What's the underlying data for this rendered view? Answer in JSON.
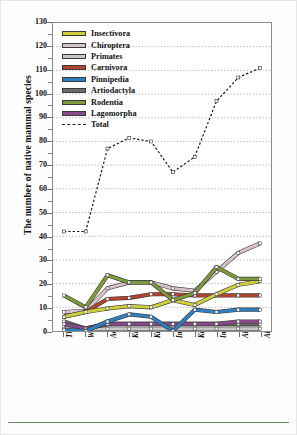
{
  "chart_data": {
    "type": "line",
    "title": "",
    "xlabel": "",
    "ylabel": "The number of native mammal species",
    "ylim": [
      0,
      130
    ],
    "ytick_step": 10,
    "yticks": [
      0,
      10,
      20,
      30,
      40,
      50,
      60,
      70,
      80,
      90,
      100,
      110,
      120,
      130
    ],
    "grid": true,
    "legend_position": "top-left",
    "categories": [
      "Thomas (1906, 1907)",
      "Wallace (1911)",
      "Aoki (1913)",
      "Kishida (1924)",
      "Kuroda (1940)",
      "Imaizumi (1949)",
      "Kuroda (1953)",
      "Imaizumi (1960)",
      "Abe et al. (1994)",
      "Abe et al. (2005)"
    ],
    "series": [
      {
        "name": "Insectivora",
        "color": "#cfcf3c",
        "values": [
          6,
          8,
          9.5,
          10.5,
          10,
          13,
          11,
          15.5,
          19.5,
          21
        ]
      },
      {
        "name": "Chiroptera",
        "color": "#d8c2cc",
        "values": [
          8,
          8.5,
          18,
          20.5,
          20.5,
          18,
          17,
          25,
          33,
          37
        ]
      },
      {
        "name": "Primates",
        "color": "#c8c8c8",
        "values": [
          1,
          1,
          1,
          1,
          1,
          1,
          1,
          1,
          1,
          1
        ]
      },
      {
        "name": "Carnivora",
        "color": "#b04430",
        "values": [
          6,
          8,
          13.5,
          14,
          15.5,
          15.5,
          15,
          15,
          15,
          15
        ]
      },
      {
        "name": "Pinnipedia",
        "color": "#2f7fc0",
        "values": [
          0.5,
          0,
          4,
          7,
          6,
          0,
          9,
          8,
          9,
          9
        ]
      },
      {
        "name": "Artiodactyla",
        "color": "#6b6b6b",
        "values": [
          4,
          1,
          3,
          3,
          3,
          3,
          3,
          3,
          3,
          3
        ]
      },
      {
        "name": "Rodentia",
        "color": "#7d9b3c",
        "values": [
          15,
          10,
          23.5,
          20.5,
          20.5,
          13,
          16,
          27,
          22,
          22
        ]
      },
      {
        "name": "Lagomorpha",
        "color": "#8a4a8a",
        "values": [
          3,
          1,
          3,
          3,
          3,
          3,
          3,
          3,
          4,
          4
        ]
      },
      {
        "name": "Total",
        "color": "#1a1a1a",
        "style": "dashed",
        "values": [
          42,
          42,
          77,
          81.5,
          80,
          67,
          73.5,
          97,
          107,
          111
        ]
      }
    ]
  },
  "legend": {
    "items": [
      {
        "label": "Insectivora"
      },
      {
        "label": "Chiroptera"
      },
      {
        "label": "Primates"
      },
      {
        "label": "Carnivora"
      },
      {
        "label": "Pinnipedia"
      },
      {
        "label": "Artiodactyla"
      },
      {
        "label": "Rodentia"
      },
      {
        "label": "Lagomorpha"
      },
      {
        "label": "Total"
      }
    ]
  }
}
